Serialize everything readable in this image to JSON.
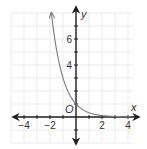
{
  "chart_data": {
    "type": "line",
    "title": "",
    "xlabel": "x",
    "ylabel": "y",
    "origin_label": "O",
    "function": "y = (1/3)^x",
    "xlim": [
      -5,
      4.4
    ],
    "ylim": [
      -2,
      8
    ],
    "grid": true,
    "x_ticks": [
      -4,
      -2,
      2,
      4
    ],
    "x_tick_labels": [
      "−4",
      "−2",
      "2",
      "4"
    ],
    "y_ticks": [
      4,
      6
    ],
    "y_tick_labels": [
      "4",
      "6"
    ],
    "series": [
      {
        "name": "curve",
        "x": [
          -1.89,
          -1.63,
          -1.26,
          -1,
          -0.5,
          0,
          0.5,
          1,
          2,
          3,
          4
        ],
        "y": [
          8,
          6,
          4,
          3,
          1.73,
          1,
          0.58,
          0.33,
          0.11,
          0.04,
          0.01
        ],
        "arrow_end": "upper-left"
      }
    ],
    "legend": null
  },
  "colors": {
    "grid": "#ebebeb",
    "axis": "#1f1f1f",
    "curve": "#7a7a7a",
    "text": "#333333"
  },
  "layout": {
    "origin_px": [
      76,
      117
    ],
    "unit_px": 13
  }
}
